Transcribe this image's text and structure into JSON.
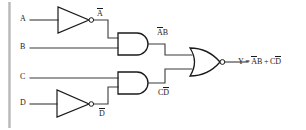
{
  "diagram": {
    "colors": {
      "wire": "#3a3a3a",
      "gate_stroke": "#1a1a1a",
      "text": "#1a1a1a",
      "left_bar": "#c8c8c8",
      "background": "#ffffff"
    },
    "inputs": [
      {
        "name": "input-a",
        "label": "A",
        "x": 22,
        "y": 16
      },
      {
        "name": "input-b",
        "label": "B",
        "x": 22,
        "y": 43
      },
      {
        "name": "input-c",
        "label": "C",
        "x": 22,
        "y": 74
      },
      {
        "name": "input-d",
        "label": "D",
        "x": 22,
        "y": 100
      }
    ],
    "intermediate_labels": [
      {
        "name": "node-not-a",
        "base": "A",
        "overbar": true,
        "suffix": "",
        "x": 98,
        "y": 10
      },
      {
        "name": "node-and-top",
        "base": "A",
        "overbar": true,
        "suffix": "B",
        "x": 158,
        "y": 29
      },
      {
        "name": "node-not-d",
        "base": "D",
        "overbar": true,
        "suffix": "",
        "x": 100,
        "y": 110
      },
      {
        "name": "node-and-bottom",
        "base": "D",
        "overbar": true,
        "prefix": "C",
        "x": 159,
        "y": 89
      }
    ],
    "output": {
      "name": "output-expression",
      "y_symbol": "Y",
      "equals": "=",
      "term1_overbar": "A",
      "term1_rest": "B",
      "plus": "+",
      "term2_pre": "C",
      "term2_overbar": "D",
      "full_text": "Y = ĀB + CD̅",
      "x": 238,
      "y": 56
    },
    "gates": [
      {
        "name": "inverter-a",
        "type": "NOT",
        "x": 58,
        "y": 7,
        "w": 32,
        "h": 26
      },
      {
        "name": "and-gate-top",
        "type": "AND",
        "x": 118,
        "y": 33,
        "w": 30,
        "h": 22
      },
      {
        "name": "inverter-d",
        "type": "NOT",
        "x": 57,
        "y": 90,
        "w": 33,
        "h": 27
      },
      {
        "name": "and-gate-bottom",
        "type": "AND",
        "x": 118,
        "y": 72,
        "w": 30,
        "h": 22
      },
      {
        "name": "nor-gate-output",
        "type": "NOR",
        "x": 190,
        "y": 48,
        "w": 32,
        "h": 28
      }
    ]
  }
}
